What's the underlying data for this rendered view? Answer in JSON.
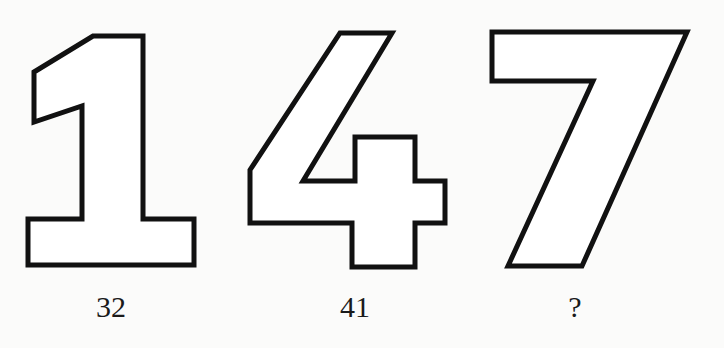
{
  "puzzle": {
    "figures": [
      {
        "digit": "1",
        "label": "32"
      },
      {
        "digit": "4",
        "label": "41"
      },
      {
        "digit": "7",
        "label": "?"
      }
    ],
    "outline_color": "#111111",
    "fill_color": "#ffffff",
    "background_color": "#fbfbfa"
  }
}
